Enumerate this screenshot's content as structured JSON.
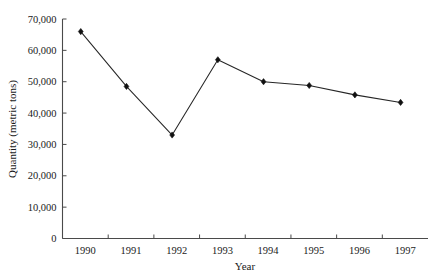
{
  "chart_data": {
    "type": "line",
    "title": "",
    "subtitle": "",
    "xlabel": "Year",
    "ylabel": "Quantity (metric tons)",
    "categories": [
      "1990",
      "1991",
      "1992",
      "1993",
      "1994",
      "1995",
      "1996",
      "1997"
    ],
    "x": [
      1990,
      1991,
      1992,
      1993,
      1994,
      1995,
      1996,
      1997
    ],
    "values": [
      66000,
      48500,
      33000,
      57000,
      50000,
      48800,
      45800,
      43400
    ],
    "series": [
      {
        "name": "Quantity",
        "values": [
          66000,
          48500,
          33000,
          57000,
          50000,
          48800,
          45800,
          43400
        ],
        "color": "#111111",
        "marker": "diamond"
      }
    ],
    "ylim": [
      0,
      70000
    ],
    "xlim": [
      1989.6,
      1997.6
    ],
    "yticks": [
      0,
      10000,
      20000,
      30000,
      40000,
      50000,
      60000,
      70000
    ],
    "ytick_labels": [
      "0",
      "10,000",
      "20,000",
      "30,000",
      "40,000",
      "50,000",
      "60,000",
      "70,000"
    ],
    "xtick_labels": [
      "1990",
      "1991",
      "1992",
      "1993",
      "1994",
      "1995",
      "1996",
      "1997"
    ],
    "grid": false,
    "legend": false,
    "legend_position": "none",
    "annotations": []
  },
  "axes": {
    "x_title": "Year",
    "y_title": "Quantity (metric tons)"
  }
}
